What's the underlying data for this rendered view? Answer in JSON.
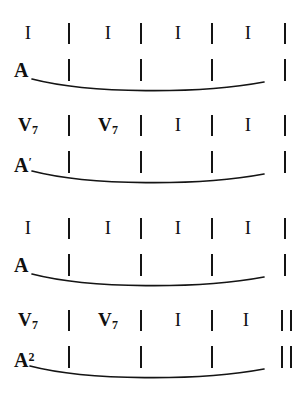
{
  "figure": {
    "kind": "harmonic-phrase-diagram",
    "ink_color": "#141414",
    "background_color": "#ffffff",
    "systems": [
      {
        "id": "system-1",
        "chords": [
          "I",
          "I",
          "I",
          "I"
        ],
        "chord_separators": [
          "|",
          "|",
          "|",
          "|"
        ],
        "final_barline": "|",
        "phrase_label": "A",
        "phrase_label_base": "A",
        "phrase_label_mark": "",
        "phrase_separators": [
          "|",
          "|",
          "|",
          "|"
        ],
        "phrase_final_barline": "|",
        "has_phrase_arc": true
      },
      {
        "id": "system-2",
        "chords": [
          "V7",
          "V7",
          "I",
          "I"
        ],
        "chord_bases": [
          "V",
          "V",
          "I",
          "I"
        ],
        "chord_subscripts": [
          "7",
          "7",
          "",
          ""
        ],
        "chord_separators": [
          "|",
          "|",
          "|",
          "|"
        ],
        "final_barline": "|",
        "phrase_label": "A′",
        "phrase_label_base": "A",
        "phrase_label_mark": "′",
        "phrase_separators": [
          "|",
          "|",
          "|",
          "|"
        ],
        "phrase_final_barline": "|",
        "has_phrase_arc": true
      },
      {
        "id": "system-3",
        "chords": [
          "I",
          "I",
          "I",
          "I"
        ],
        "chord_separators": [
          "|",
          "|",
          "|",
          "|"
        ],
        "final_barline": "|",
        "phrase_label": "A",
        "phrase_label_base": "A",
        "phrase_label_mark": "",
        "phrase_separators": [
          "|",
          "|",
          "|",
          "|"
        ],
        "phrase_final_barline": "|",
        "has_phrase_arc": true
      },
      {
        "id": "system-4",
        "chords": [
          "V7",
          "V7",
          "I",
          "I"
        ],
        "chord_bases": [
          "V",
          "V",
          "I",
          "I"
        ],
        "chord_subscripts": [
          "7",
          "7",
          "",
          ""
        ],
        "chord_separators": [
          "|",
          "|",
          "|",
          "‖"
        ],
        "final_barline": "‖",
        "phrase_label": "A²",
        "phrase_label_base": "A",
        "phrase_label_mark": "2",
        "phrase_separators": [
          "|",
          "|",
          "|",
          "‖"
        ],
        "phrase_final_barline": "‖",
        "has_phrase_arc": true
      }
    ]
  }
}
